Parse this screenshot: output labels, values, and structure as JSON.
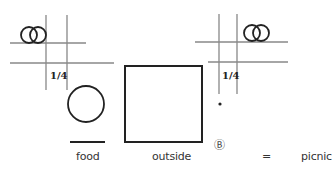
{
  "diagram": {
    "left_sign": {
      "fraction": "1/4",
      "icon": "interlocked-rings"
    },
    "right_sign": {
      "fraction": "1/4",
      "icon": "interlocked-rings"
    },
    "glyphs": {
      "food": {
        "label": "food",
        "shape": "circle-over-line"
      },
      "outside": {
        "label": "outside",
        "shape": "square"
      },
      "marker": {
        "label": "Ⓑ"
      },
      "equals": "=",
      "result": "picnic"
    },
    "colors": {
      "ink": "#222222",
      "grid": "#888888"
    }
  }
}
